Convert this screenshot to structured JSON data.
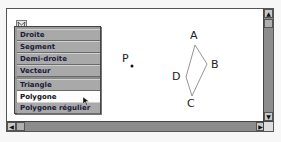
{
  "window": {
    "tool_icon": "toolbox-icon"
  },
  "menu": {
    "items": [
      {
        "label": "Droite"
      },
      {
        "label": "Segment"
      },
      {
        "label": "Demi-droite"
      },
      {
        "label": "Vecteur"
      },
      {
        "label": "Triangle"
      },
      {
        "label": "Polygone",
        "selected": true
      },
      {
        "label": "Polygone régulier"
      }
    ]
  },
  "canvas": {
    "points": {
      "P": {
        "label": "P"
      },
      "A": {
        "label": "A"
      },
      "B": {
        "label": "B"
      },
      "C": {
        "label": "C"
      },
      "D": {
        "label": "D"
      }
    }
  },
  "scrollbars": {
    "up": "▲",
    "down": "▼",
    "left": "◀",
    "right": "▶"
  }
}
